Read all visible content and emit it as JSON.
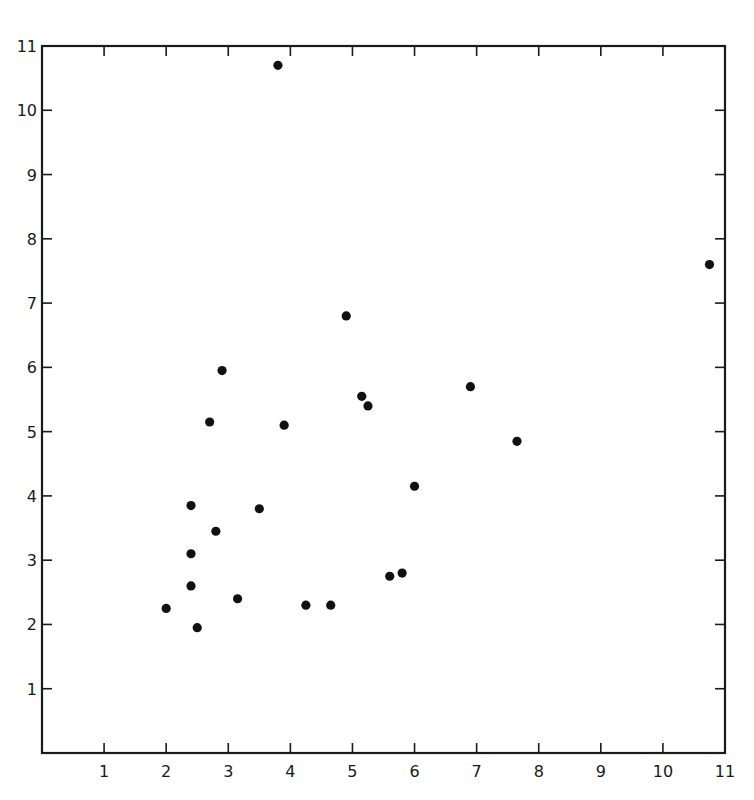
{
  "chart_data": {
    "type": "scatter",
    "title": "",
    "xlabel": "",
    "ylabel": "",
    "xlim": [
      0,
      11
    ],
    "ylim": [
      0,
      11
    ],
    "grid": false,
    "legend": null,
    "frame": "box with inward ticks on all four sides; labels on bottom and left only",
    "x_ticks": [
      1,
      2,
      3,
      4,
      5,
      6,
      7,
      8,
      9,
      10,
      11
    ],
    "y_ticks": [
      1,
      2,
      3,
      4,
      5,
      6,
      7,
      8,
      9,
      10,
      11
    ],
    "x_tick_labels": [
      "1",
      "2",
      "3",
      "4",
      "5",
      "6",
      "7",
      "8",
      "9",
      "10",
      "11"
    ],
    "y_tick_labels": [
      "1",
      "2",
      "3",
      "4",
      "5",
      "6",
      "7",
      "8",
      "9",
      "10",
      "11"
    ],
    "series": [
      {
        "name": "points",
        "marker": "filled-circle",
        "color": "#111111",
        "x": [
          3.8,
          10.75,
          4.9,
          2.9,
          2.7,
          3.9,
          5.15,
          5.25,
          6.9,
          7.65,
          6.0,
          2.4,
          3.5,
          2.8,
          2.4,
          2.4,
          3.15,
          2.0,
          2.5,
          4.25,
          4.65,
          5.6,
          5.8
        ],
        "y": [
          10.7,
          7.6,
          6.8,
          5.95,
          5.15,
          5.1,
          5.55,
          5.4,
          5.7,
          4.85,
          4.15,
          3.85,
          3.8,
          3.45,
          3.1,
          2.6,
          2.4,
          2.25,
          1.95,
          2.3,
          2.3,
          2.75,
          2.8
        ]
      }
    ]
  }
}
